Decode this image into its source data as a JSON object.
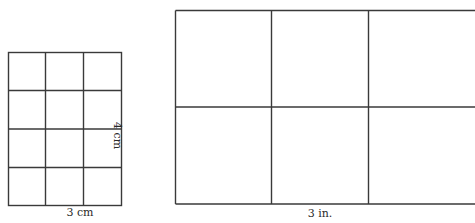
{
  "figures": [
    {
      "id": "centimeter-grid",
      "rows": 4,
      "cols": 3,
      "width_label": "3 cm",
      "height_label": "4 cm",
      "box": {
        "x": 8,
        "y": 52,
        "w": 113,
        "h": 153
      }
    },
    {
      "id": "inch-grid",
      "rows": 2,
      "cols": 3,
      "width_label": "3 in.",
      "box": {
        "x": 175,
        "y": 10,
        "w": 290,
        "h": 194
      },
      "cropped_right": true
    }
  ],
  "colors": {
    "line": "#3a3a3a",
    "background": "#ffffff"
  }
}
